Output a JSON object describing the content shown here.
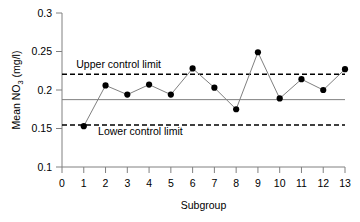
{
  "chart_data": {
    "type": "line",
    "title": "",
    "xlabel": "Subgroup",
    "ylabel": "Mean NO3 (mg/l)",
    "ylabel_parts": {
      "pre": "Mean NO",
      "sub": "3",
      "post": " (mg/l)"
    },
    "x": [
      1,
      2,
      3,
      4,
      5,
      6,
      7,
      8,
      9,
      10,
      11,
      12,
      13
    ],
    "categories": [
      "1",
      "2",
      "3",
      "4",
      "5",
      "6",
      "7",
      "8",
      "9",
      "10",
      "11",
      "12",
      "13"
    ],
    "values": [
      0.153,
      0.206,
      0.194,
      0.207,
      0.194,
      0.228,
      0.203,
      0.175,
      0.249,
      0.189,
      0.214,
      0.2,
      0.227
    ],
    "series": [
      {
        "name": "Mean NO3",
        "values": [
          0.153,
          0.206,
          0.194,
          0.207,
          0.194,
          0.228,
          0.203,
          0.175,
          0.249,
          0.189,
          0.214,
          0.2,
          0.227
        ]
      }
    ],
    "xlim": [
      0,
      13
    ],
    "ylim": [
      0.1,
      0.3
    ],
    "xticks": [
      0,
      1,
      2,
      3,
      4,
      5,
      6,
      7,
      8,
      9,
      10,
      11,
      12,
      13
    ],
    "xtick_labels": [
      "0",
      "1",
      "2",
      "3",
      "4",
      "5",
      "6",
      "7",
      "8",
      "9",
      "10",
      "11",
      "12",
      "13"
    ],
    "yticks": [
      0.1,
      0.15,
      0.2,
      0.25,
      0.3
    ],
    "ytick_labels": [
      "0.1",
      "0.15",
      "0.2",
      "0.25",
      "0.3"
    ],
    "grid": false,
    "legend": "none",
    "marker": "filled-circle",
    "reference_lines": [
      {
        "name": "upper-control-limit",
        "label": "Upper control limit",
        "value": 0.2205,
        "style": "dashed",
        "color": "#000000"
      },
      {
        "name": "center-line",
        "label": "",
        "value": 0.1875,
        "style": "solid",
        "color": "#808080"
      },
      {
        "name": "lower-control-limit",
        "label": "Lower control limit",
        "value": 0.1545,
        "style": "dashed",
        "color": "#000000"
      }
    ],
    "annotations": [
      {
        "name": "upper-control-limit-label",
        "text": "Upper control limit",
        "x": 2.6,
        "y": 0.2335
      },
      {
        "name": "lower-control-limit-label",
        "text": "Lower control limit",
        "x": 3.6,
        "y": 0.1465
      }
    ],
    "colors": {
      "series_line": "#808080",
      "marker": "#000000",
      "axis": "#808080",
      "control_limit": "#000000",
      "center_line": "#808080",
      "background": "#ffffff",
      "text": "#000000"
    }
  }
}
